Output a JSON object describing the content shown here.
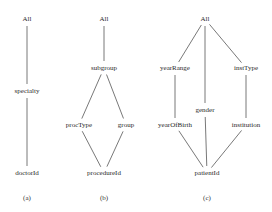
{
  "diagrams": [
    {
      "id": "a",
      "caption": "(a)",
      "caption_pos": [
        27,
        198
      ],
      "nodes": [
        {
          "key": "all",
          "label": "All",
          "x": 27,
          "y": 19
        },
        {
          "key": "specialty",
          "label": "specialty",
          "x": 27,
          "y": 91
        },
        {
          "key": "doctorId",
          "label": "doctorId",
          "x": 27,
          "y": 173
        }
      ],
      "edges": [
        [
          "all",
          "specialty"
        ],
        [
          "specialty",
          "doctorId"
        ]
      ]
    },
    {
      "id": "b",
      "caption": "(b)",
      "caption_pos": [
        104,
        198
      ],
      "nodes": [
        {
          "key": "all",
          "label": "All",
          "x": 104,
          "y": 19
        },
        {
          "key": "subgroup",
          "label": "subgroup",
          "x": 104,
          "y": 68
        },
        {
          "key": "procType",
          "label": "procType",
          "x": 79,
          "y": 125
        },
        {
          "key": "group",
          "label": "group",
          "x": 126,
          "y": 125
        },
        {
          "key": "procedureId",
          "label": "procedureId",
          "x": 104,
          "y": 173
        }
      ],
      "edges": [
        [
          "all",
          "subgroup"
        ],
        [
          "subgroup",
          "procType"
        ],
        [
          "subgroup",
          "group"
        ],
        [
          "procType",
          "procedureId"
        ],
        [
          "group",
          "procedureId"
        ]
      ]
    },
    {
      "id": "c",
      "caption": "(c)",
      "caption_pos": [
        207,
        198
      ],
      "nodes": [
        {
          "key": "all",
          "label": "All",
          "x": 205,
          "y": 19
        },
        {
          "key": "yearRange",
          "label": "yearRange",
          "x": 175,
          "y": 68
        },
        {
          "key": "instType",
          "label": "instType",
          "x": 246,
          "y": 68
        },
        {
          "key": "gender",
          "label": "gender",
          "x": 205,
          "y": 110
        },
        {
          "key": "yearOfBirth",
          "label": "yearOfBirth",
          "x": 175,
          "y": 125
        },
        {
          "key": "institution",
          "label": "institution",
          "x": 246,
          "y": 125
        },
        {
          "key": "patientId",
          "label": "patientId",
          "x": 207,
          "y": 173
        }
      ],
      "edges": [
        [
          "all",
          "yearRange"
        ],
        [
          "all",
          "gender"
        ],
        [
          "all",
          "instType"
        ],
        [
          "yearRange",
          "yearOfBirth"
        ],
        [
          "instType",
          "institution"
        ],
        [
          "yearOfBirth",
          "patientId"
        ],
        [
          "gender",
          "patientId"
        ],
        [
          "institution",
          "patientId"
        ]
      ]
    }
  ],
  "style": {
    "edge_color": "#555555",
    "text_color": "#2a2a2a",
    "background": "#ffffff"
  }
}
